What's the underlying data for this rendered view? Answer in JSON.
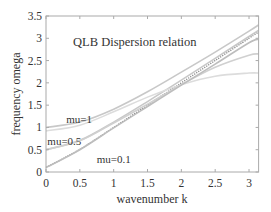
{
  "chart_data": {
    "type": "line",
    "title": "QLB Dispersion relation",
    "xlabel": "wavenumber k",
    "ylabel": "frequency omega",
    "xlim": [
      0,
      3.1416
    ],
    "ylim": [
      0,
      3.5
    ],
    "xticks": [
      0,
      0.5,
      1,
      1.5,
      2,
      2.5,
      3
    ],
    "xtick_labels": [
      "0",
      "0.5",
      "1",
      "1.5",
      "2",
      "2.5",
      "3"
    ],
    "yticks": [
      0,
      0.5,
      1,
      1.5,
      2,
      2.5,
      3,
      3.5
    ],
    "ytick_labels": [
      "0",
      "0.5",
      "1",
      "1.5",
      "2",
      "2.5",
      "3",
      "3.5"
    ],
    "grid": false,
    "legend": "none",
    "annotations": [
      {
        "text": "mu=1",
        "x": 0.3,
        "y": 1.2
      },
      {
        "text": "mu=0.5",
        "x": 0.02,
        "y": 0.7
      },
      {
        "text": "mu=0.1",
        "x": 0.75,
        "y": 0.3
      }
    ],
    "series": [
      {
        "name": "mu=1 continuum",
        "style": "solid",
        "color": "#c8c8c8",
        "x": [
          0,
          0.5,
          1,
          1.5,
          2,
          2.5,
          3,
          3.1416
        ],
        "values": [
          1.0,
          1.12,
          1.41,
          1.8,
          2.24,
          2.69,
          3.16,
          3.3
        ]
      },
      {
        "name": "mu=0.5 continuum",
        "style": "solid",
        "color": "#c8c8c8",
        "x": [
          0,
          0.5,
          1,
          1.5,
          2,
          2.5,
          3,
          3.1416
        ],
        "values": [
          0.5,
          0.71,
          1.12,
          1.58,
          2.06,
          2.55,
          3.04,
          3.18
        ]
      },
      {
        "name": "mu=0.1 continuum",
        "style": "dotted",
        "color": "#888888",
        "x": [
          0,
          0.5,
          1,
          1.5,
          2,
          2.5,
          3,
          3.1416
        ],
        "values": [
          0.1,
          0.51,
          1.0,
          1.5,
          2.0,
          2.5,
          3.0,
          3.14
        ]
      },
      {
        "name": "mu=1 lattice",
        "style": "solid",
        "color": "#dcdcdc",
        "x": [
          0,
          0.5,
          1,
          1.5,
          2,
          2.5,
          3,
          3.1416
        ],
        "values": [
          0.92,
          1.05,
          1.35,
          1.68,
          1.96,
          2.15,
          2.22,
          2.22
        ]
      },
      {
        "name": "mu=0.5 lattice",
        "style": "solid",
        "color": "#d0d0d0",
        "x": [
          0,
          0.5,
          1,
          1.5,
          2,
          2.5,
          3,
          3.1416
        ],
        "values": [
          0.5,
          0.7,
          1.1,
          1.52,
          1.96,
          2.35,
          2.62,
          2.65
        ]
      },
      {
        "name": "mu=0.1 lattice",
        "style": "solid",
        "color": "#bdbdbd",
        "x": [
          0,
          0.5,
          1,
          1.5,
          2,
          2.5,
          3,
          3.1416
        ],
        "values": [
          0.1,
          0.5,
          0.99,
          1.47,
          1.95,
          2.42,
          2.9,
          2.98
        ]
      }
    ]
  }
}
